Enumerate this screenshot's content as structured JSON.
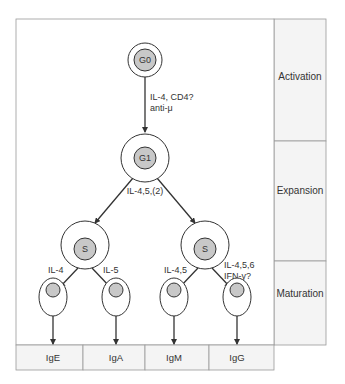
{
  "stages": [
    "Activation",
    "Expansion",
    "Maturation"
  ],
  "nodes": {
    "g0": "G0",
    "g1": "G1",
    "s_left": "S",
    "s_right": "S"
  },
  "edges": {
    "g0_g1": [
      "IL-4, CD4?",
      "anti-μ"
    ],
    "g1_s": "IL-4,5,(2)",
    "s_left_ige": "IL-4",
    "s_left_iga": "IL-5",
    "s_right_igm": "IL-4,5",
    "s_right_igg": [
      "IL-4,5,6",
      "IFN-γ?"
    ]
  },
  "outputs": [
    "IgE",
    "IgA",
    "IgM",
    "IgG"
  ],
  "colors": {
    "nucleus": "#c8c8c8",
    "line": "#333333",
    "border": "#888888",
    "panel": "#f4f4f4"
  }
}
